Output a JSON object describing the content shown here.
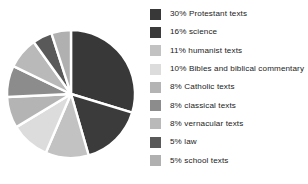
{
  "chart_data": {
    "type": "pie",
    "title": "",
    "xlabel": "",
    "ylabel": "",
    "legend_position": "right",
    "grid": false,
    "start_angle_deg": 0,
    "direction": "clockwise",
    "categories": [
      "Protestant texts",
      "science",
      "humanist texts",
      "Bibles and biblical commentary",
      "Catholic texts",
      "classical texts",
      "vernacular texts",
      "law",
      "school texts"
    ],
    "values": [
      30,
      16,
      11,
      10,
      8,
      8,
      8,
      5,
      5
    ],
    "value_unit": "%",
    "colors": [
      "#383838",
      "#3b3b3b",
      "#c2c2c2",
      "#dcdcdc",
      "#b4b4b4",
      "#8c8c8c",
      "#b9b9b9",
      "#595959",
      "#b0b0b0"
    ],
    "slice_separator_color": "#ffffff"
  },
  "legend": {
    "items": [
      {
        "label": "30% Protestant texts",
        "swatch_name": "legend-swatch-protestant-texts"
      },
      {
        "label": "16% science",
        "swatch_name": "legend-swatch-science"
      },
      {
        "label": "11% humanist texts",
        "swatch_name": "legend-swatch-humanist-texts"
      },
      {
        "label": "10% Bibles and biblical commentary",
        "swatch_name": "legend-swatch-bibles"
      },
      {
        "label": "8% Catholic texts",
        "swatch_name": "legend-swatch-catholic-texts"
      },
      {
        "label": "8% classical texts",
        "swatch_name": "legend-swatch-classical-texts"
      },
      {
        "label": "8% vernacular texts",
        "swatch_name": "legend-swatch-vernacular-texts"
      },
      {
        "label": "5% law",
        "swatch_name": "legend-swatch-law"
      },
      {
        "label": "5% school texts",
        "swatch_name": "legend-swatch-school-texts"
      }
    ]
  },
  "pie_geometry": {
    "center_x": 71,
    "center_y": 72,
    "radius": 64
  }
}
